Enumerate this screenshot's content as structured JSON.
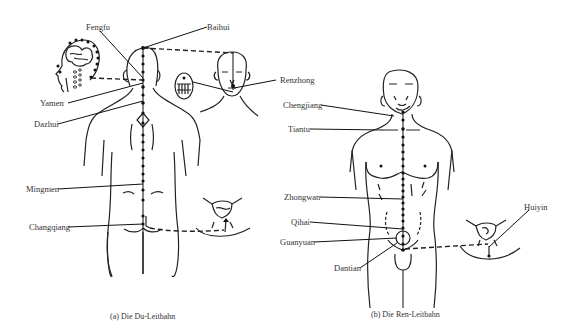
{
  "figure": {
    "panels": [
      {
        "id": "a",
        "caption": "(a) Die Du-Leitbahn",
        "view": "back",
        "points": [
          "Fengfu",
          "Baihui",
          "Yamen",
          "Dazhui",
          "Renzhong",
          "Mingmen",
          "Changqiang"
        ]
      },
      {
        "id": "b",
        "caption": "(b) Die Ren-Leitbahn",
        "view": "front",
        "points": [
          "Chengjiang",
          "Tiantu",
          "Zhongwan",
          "Qihai",
          "Guanyuan",
          "Dantian",
          "Huiyin"
        ]
      }
    ]
  },
  "labels": {
    "fengfu": "Fengfu",
    "baihui": "Baihui",
    "yamen": "Yamen",
    "dazhui": "Dazhui",
    "renzhong": "Renzhong",
    "mingmen": "Mingmen",
    "changqiang": "Changqiang",
    "chengjiang": "Chengjiang",
    "tiantu": "Tiantu",
    "zhongwan": "Zhongwan",
    "qihai": "Qihai",
    "guanyuan": "Guanyuan",
    "dantian": "Dantian",
    "huiyin": "Huiyin"
  },
  "captions": {
    "a": "(a) Die Du-Leitbahn",
    "b": "(b) Die Ren-Leitbahn"
  },
  "colors": {
    "background": "#ffffff",
    "ink": "#111111",
    "text": "#333333"
  }
}
